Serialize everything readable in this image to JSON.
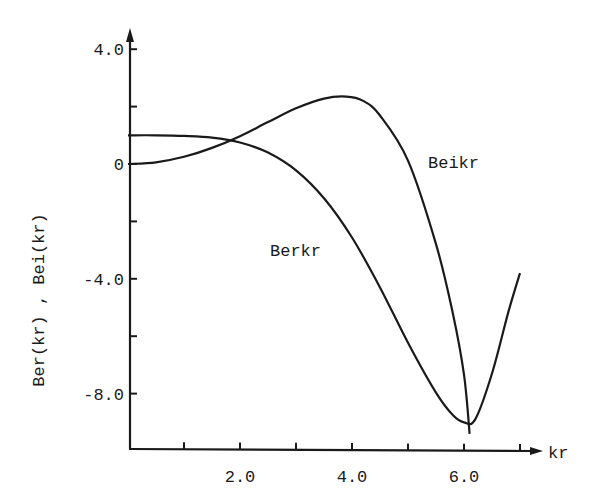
{
  "chart_data": {
    "type": "line",
    "title": "",
    "xlabel": "kr",
    "ylabel": "Ber(kr) , Bei(kr)",
    "xlim": [
      0,
      7.3
    ],
    "ylim": [
      -10,
      4.2
    ],
    "grid": false,
    "legend": "inline labels",
    "x_ticks": [
      1.0,
      2.0,
      3.0,
      4.0,
      5.0,
      6.0,
      7.0
    ],
    "x_tick_labels": [
      "",
      "2.0",
      "",
      "4.0",
      "",
      "6.0",
      ""
    ],
    "y_ticks": [
      4.0,
      2.0,
      0,
      -2.0,
      -4.0,
      -6.0,
      -8.0
    ],
    "y_tick_labels": [
      "4.0",
      "",
      "0",
      "",
      "-4.0",
      "",
      "-8.0"
    ],
    "series": [
      {
        "name": "Berkr",
        "x": [
          0,
          0.5,
          1.0,
          1.5,
          2.0,
          2.5,
          3.0,
          3.5,
          4.0,
          4.5,
          5.0,
          5.5,
          5.8,
          6.0,
          6.2,
          6.5,
          6.8,
          7.0
        ],
        "values": [
          1.0,
          1.0,
          0.98,
          0.92,
          0.75,
          0.4,
          -0.22,
          -1.19,
          -2.56,
          -4.3,
          -6.23,
          -7.97,
          -8.75,
          -9.0,
          -8.9,
          -7.3,
          -5.1,
          -3.8
        ]
      },
      {
        "name": "Beikr",
        "x": [
          0,
          0.5,
          1.0,
          1.5,
          2.0,
          2.5,
          3.0,
          3.5,
          3.9,
          4.2,
          4.5,
          5.0,
          5.5,
          5.8,
          6.0,
          6.1
        ],
        "values": [
          0,
          0.06,
          0.25,
          0.56,
          0.97,
          1.46,
          1.94,
          2.28,
          2.35,
          2.2,
          1.69,
          0.12,
          -2.79,
          -5.2,
          -7.34,
          -9.4
        ]
      }
    ],
    "annotations": [
      {
        "text": "Beikr",
        "x": 5.3,
        "y": 0.1
      },
      {
        "text": "Berkr",
        "x": 2.5,
        "y": -3.1
      }
    ]
  }
}
